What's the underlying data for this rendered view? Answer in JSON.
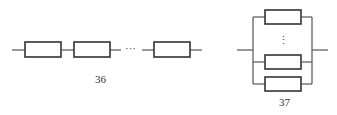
{
  "figures": [
    {
      "id": "series",
      "label": "36",
      "description": "series connection of resistive elements",
      "ellipsis": "···",
      "element_count_visible": 3
    },
    {
      "id": "parallel",
      "label": "37",
      "description": "parallel connection of resistive elements",
      "ellipsis": "⋮",
      "element_count_visible": 3
    }
  ],
  "colors": {
    "line": "#555555",
    "box_stroke": "#333333",
    "background": "#ffffff"
  }
}
